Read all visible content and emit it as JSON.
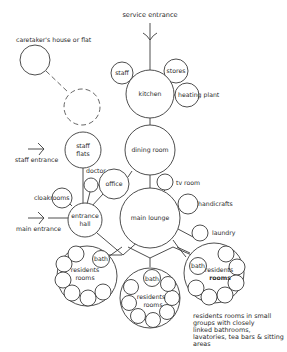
{
  "diagram": {
    "type": "bubble-diagram",
    "colors": {
      "line": "#3a3a3a",
      "text": "#2a2a2a",
      "background": "#ffffff"
    },
    "labels": {
      "service_entrance": "service entrance",
      "caretaker": "caretaker's house or flat",
      "staff": "staff",
      "stores": "stores",
      "kitchen": "kitchen",
      "heating_plant": "heating plant",
      "dining_room": "dining room",
      "staff_flats_1": "staff",
      "staff_flats_2": "flats",
      "staff_entrance": "staff entrance",
      "doctor": "doctor",
      "office": "office",
      "tv_room": "tv room",
      "handicrafts": "handicrafts",
      "cloakrooms": "cloakrooms",
      "entrance_hall_1": "entrance",
      "entrance_hall_2": "hall",
      "main_entrance": "main entrance",
      "main_lounge": "main lounge",
      "laundry": "laundry",
      "bath": "bath",
      "residents": "residents",
      "rooms": "rooms"
    },
    "residents_groups": [
      {
        "name": "left",
        "bath": "bath",
        "label1": "residents",
        "label2": "rooms"
      },
      {
        "name": "middle",
        "bath": "bath",
        "label1": "residents",
        "label2": "rooms"
      },
      {
        "name": "right",
        "bath": "bath",
        "label1": "residents",
        "label2": "rooms"
      }
    ],
    "description": [
      "residents rooms in small",
      "groups with closely",
      "linked bathrooms,",
      "lavatories, tea bars & sitting",
      "areas"
    ]
  }
}
